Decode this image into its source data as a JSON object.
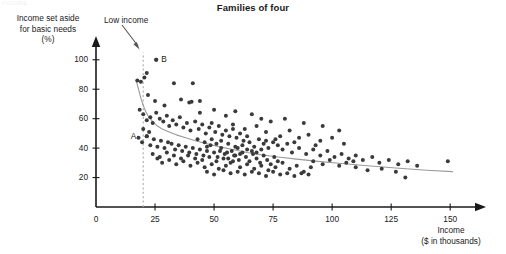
{
  "header": {
    "corner_tag": "FIGURE",
    "title": "Families of four"
  },
  "annotations": {
    "low_income": "Low income",
    "point_a": "A",
    "point_b": "B"
  },
  "chart_data": {
    "type": "scatter",
    "title": "Families of four",
    "xlabel": "Income ($ in thousands)",
    "ylabel": "Income set aside for basic needs (%)",
    "xlabel_line1": "Income",
    "xlabel_line2": "($ in thousands)",
    "ylabel_line1": "Income set aside",
    "ylabel_line2": "for basic needs",
    "ylabel_line3": "(%)",
    "grid": false,
    "legend": "none",
    "xlim": [
      0,
      155
    ],
    "ylim": [
      0,
      108
    ],
    "xticks": [
      0,
      25,
      50,
      75,
      100,
      125,
      150
    ],
    "xtick_labels": [
      "0",
      "25",
      "50",
      "75",
      "100",
      "125",
      "150"
    ],
    "yticks": [
      20,
      40,
      60,
      80,
      100
    ],
    "ytick_labels": [
      "20",
      "40",
      "60",
      "80",
      "100"
    ],
    "marker_color": "#3a3a3a",
    "marker_size": 2.0,
    "trend_color": "#9a9a9a",
    "reference_line": {
      "label": "Low income",
      "x": 20,
      "y_from": 0,
      "y_to": 105,
      "style": "dashed",
      "color": "#b0b0b0"
    },
    "labeled_points": [
      {
        "name": "A",
        "x": 21.5,
        "y": 48
      },
      {
        "name": "B",
        "x": 25.5,
        "y": 100
      }
    ],
    "trend_curve": [
      [
        17,
        86
      ],
      [
        18,
        80
      ],
      [
        19,
        74
      ],
      [
        20,
        69
      ],
      [
        21,
        65
      ],
      [
        22,
        62
      ],
      [
        24,
        58
      ],
      [
        26,
        55
      ],
      [
        28,
        53
      ],
      [
        31,
        51
      ],
      [
        34,
        49
      ],
      [
        38,
        47
      ],
      [
        42,
        45
      ],
      [
        47,
        43
      ],
      [
        52,
        41
      ],
      [
        58,
        39
      ],
      [
        64,
        37
      ],
      [
        70,
        35.5
      ],
      [
        77,
        34
      ],
      [
        85,
        32.5
      ],
      [
        94,
        31
      ],
      [
        104,
        29.5
      ],
      [
        115,
        28
      ],
      [
        127,
        26.5
      ],
      [
        140,
        25
      ],
      [
        151,
        24
      ]
    ],
    "points": [
      [
        17.5,
        86
      ],
      [
        19.0,
        85
      ],
      [
        20.5,
        88
      ],
      [
        21.5,
        91
      ],
      [
        25.5,
        100
      ],
      [
        33.0,
        84
      ],
      [
        41.0,
        84
      ],
      [
        22.0,
        76
      ],
      [
        25.0,
        72
      ],
      [
        29.0,
        69
      ],
      [
        36.0,
        73
      ],
      [
        39.5,
        71
      ],
      [
        40.5,
        71.5
      ],
      [
        44.0,
        72
      ],
      [
        18.5,
        66
      ],
      [
        20.0,
        63
      ],
      [
        21.5,
        59
      ],
      [
        23.0,
        61
      ],
      [
        24.0,
        57
      ],
      [
        25.5,
        64
      ],
      [
        27.0,
        60
      ],
      [
        28.5,
        58
      ],
      [
        30.0,
        62
      ],
      [
        31.0,
        55
      ],
      [
        32.5,
        59
      ],
      [
        34.0,
        56
      ],
      [
        35.5,
        61
      ],
      [
        37.0,
        54
      ],
      [
        38.5,
        57
      ],
      [
        40.0,
        52
      ],
      [
        42.0,
        58
      ],
      [
        43.5,
        53
      ],
      [
        45.0,
        56
      ],
      [
        46.5,
        50
      ],
      [
        48.0,
        54
      ],
      [
        49.0,
        57
      ],
      [
        50.5,
        51
      ],
      [
        52.0,
        55
      ],
      [
        53.5,
        49
      ],
      [
        55.0,
        52
      ],
      [
        56.5,
        48
      ],
      [
        58.0,
        53
      ],
      [
        59.5,
        47
      ],
      [
        61.0,
        50
      ],
      [
        62.5,
        45
      ],
      [
        64.0,
        48
      ],
      [
        18.0,
        47
      ],
      [
        19.5,
        44
      ],
      [
        21.5,
        48
      ],
      [
        23.0,
        42
      ],
      [
        24.5,
        46
      ],
      [
        26.0,
        41
      ],
      [
        27.5,
        45
      ],
      [
        29.0,
        40
      ],
      [
        30.5,
        44
      ],
      [
        32.0,
        43
      ],
      [
        33.5,
        39
      ],
      [
        35.0,
        42
      ],
      [
        36.5,
        38
      ],
      [
        38.0,
        41
      ],
      [
        39.5,
        37
      ],
      [
        41.0,
        40
      ],
      [
        42.5,
        36
      ],
      [
        44.0,
        39
      ],
      [
        45.5,
        35
      ],
      [
        47.0,
        38
      ],
      [
        48.5,
        42
      ],
      [
        50.0,
        37
      ],
      [
        51.5,
        34
      ],
      [
        53.0,
        40
      ],
      [
        54.5,
        36
      ],
      [
        56.0,
        33
      ],
      [
        57.5,
        38
      ],
      [
        59.0,
        35
      ],
      [
        60.5,
        32
      ],
      [
        62.0,
        37
      ],
      [
        63.5,
        34
      ],
      [
        65.0,
        31
      ],
      [
        66.5,
        36
      ],
      [
        68.0,
        33
      ],
      [
        69.5,
        30
      ],
      [
        71.0,
        35
      ],
      [
        72.5,
        32
      ],
      [
        74.0,
        29
      ],
      [
        75.5,
        34
      ],
      [
        77.0,
        31
      ],
      [
        26.0,
        33
      ],
      [
        28.0,
        30
      ],
      [
        31.0,
        32
      ],
      [
        34.0,
        29
      ],
      [
        37.0,
        31
      ],
      [
        40.0,
        28
      ],
      [
        43.0,
        30
      ],
      [
        46.0,
        27
      ],
      [
        49.0,
        29
      ],
      [
        52.0,
        26
      ],
      [
        55.0,
        28
      ],
      [
        58.0,
        31
      ],
      [
        61.0,
        27
      ],
      [
        64.0,
        29
      ],
      [
        67.0,
        26
      ],
      [
        70.0,
        28
      ],
      [
        73.0,
        25
      ],
      [
        76.0,
        27
      ],
      [
        79.0,
        30
      ],
      [
        82.0,
        26
      ],
      [
        85.0,
        28
      ],
      [
        88.0,
        24
      ],
      [
        91.0,
        27
      ],
      [
        47.0,
        24
      ],
      [
        50.0,
        22
      ],
      [
        54.0,
        25
      ],
      [
        57.0,
        23
      ],
      [
        60.0,
        24
      ],
      [
        63.0,
        22
      ],
      [
        66.0,
        24
      ],
      [
        69.0,
        23
      ],
      [
        72.0,
        21
      ],
      [
        75.0,
        24
      ],
      [
        78.0,
        22
      ],
      [
        81.0,
        23
      ],
      [
        84.0,
        21
      ],
      [
        87.0,
        23
      ],
      [
        90.0,
        22
      ],
      [
        65.0,
        44
      ],
      [
        67.0,
        41
      ],
      [
        69.0,
        46
      ],
      [
        71.0,
        43
      ],
      [
        73.0,
        40
      ],
      [
        75.0,
        44
      ],
      [
        77.0,
        42
      ],
      [
        79.0,
        39
      ],
      [
        81.0,
        43
      ],
      [
        83.0,
        37
      ],
      [
        86.0,
        40
      ],
      [
        89.0,
        36
      ],
      [
        92.0,
        39
      ],
      [
        95.0,
        35
      ],
      [
        98.0,
        38
      ],
      [
        101.0,
        34
      ],
      [
        104.0,
        36
      ],
      [
        107.0,
        33
      ],
      [
        110.0,
        35
      ],
      [
        58.0,
        56
      ],
      [
        63.0,
        53
      ],
      [
        68.0,
        55
      ],
      [
        72.0,
        51
      ],
      [
        78.0,
        48
      ],
      [
        82.0,
        52
      ],
      [
        86.0,
        47
      ],
      [
        90.0,
        49
      ],
      [
        95.0,
        45
      ],
      [
        100.0,
        47
      ],
      [
        105.0,
        43
      ],
      [
        80.0,
        60
      ],
      [
        88.0,
        57
      ],
      [
        96.0,
        55
      ],
      [
        103.0,
        52
      ],
      [
        55.0,
        62
      ],
      [
        59.0,
        65
      ],
      [
        66.0,
        63
      ],
      [
        70.0,
        60
      ],
      [
        74.0,
        58
      ],
      [
        50.0,
        66
      ],
      [
        44.0,
        64
      ],
      [
        113.0,
        32
      ],
      [
        117.0,
        34
      ],
      [
        120.0,
        30
      ],
      [
        124.0,
        32
      ],
      [
        128.0,
        29
      ],
      [
        132.0,
        31
      ],
      [
        136.0,
        28
      ],
      [
        110.0,
        27
      ],
      [
        115.0,
        25
      ],
      [
        121.0,
        26
      ],
      [
        127.0,
        24
      ],
      [
        131.0,
        20
      ],
      [
        149.0,
        31
      ],
      [
        92.0,
        31
      ],
      [
        96.0,
        29
      ],
      [
        99.0,
        32
      ],
      [
        103.0,
        28
      ],
      [
        106.0,
        30
      ],
      [
        109.0,
        31
      ],
      [
        24.0,
        36
      ],
      [
        27.0,
        34
      ],
      [
        30.0,
        37
      ],
      [
        33.0,
        35
      ],
      [
        36.0,
        33
      ],
      [
        39.0,
        35
      ],
      [
        42.0,
        33
      ],
      [
        45.0,
        32
      ],
      [
        48.0,
        34
      ],
      [
        51.0,
        31
      ],
      [
        54.0,
        33
      ],
      [
        57.0,
        30
      ],
      [
        60.0,
        40
      ],
      [
        62.0,
        42
      ],
      [
        64.0,
        39
      ],
      [
        66.0,
        38
      ],
      [
        68.0,
        37
      ],
      [
        70.0,
        39
      ],
      [
        46.0,
        44
      ],
      [
        43.0,
        46
      ],
      [
        56.0,
        43
      ],
      [
        59.0,
        41
      ],
      [
        20.0,
        53
      ],
      [
        22.5,
        51
      ],
      [
        53.0,
        45
      ],
      [
        51.0,
        43
      ],
      [
        49.0,
        46
      ],
      [
        47.0,
        41
      ],
      [
        61.0,
        36
      ],
      [
        58.5,
        35
      ],
      [
        55.5,
        37
      ],
      [
        52.5,
        38
      ],
      [
        72.0,
        45
      ],
      [
        76.0,
        46
      ],
      [
        84.0,
        44
      ],
      [
        93.0,
        42
      ]
    ]
  }
}
